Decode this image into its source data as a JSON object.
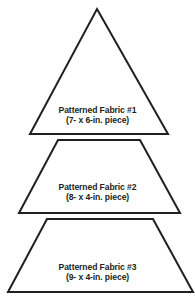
{
  "diagram": {
    "stroke_color": "#231f20",
    "fill_color": "#ffffff",
    "pieces": [
      {
        "shape": "triangle",
        "title": "Patterned Fabric #1",
        "size": "(7- x 6-in. piece)",
        "points": "97,9 168,134 30,134"
      },
      {
        "shape": "trapezoid",
        "title": "Patterned Fabric #2",
        "size": "(8- x 4-in. piece)",
        "points": "58,140 140,140 180,213 19,213"
      },
      {
        "shape": "trapezoid",
        "title": "Patterned Fabric #3",
        "size": "(9- x 4-in. piece)",
        "points": "47,219 153,219 193,292 8,292"
      }
    ]
  }
}
